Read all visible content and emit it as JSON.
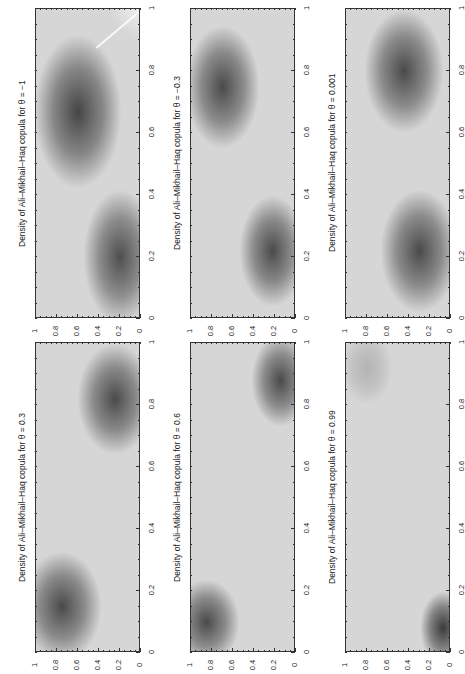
{
  "chart_data": [
    {
      "type": "heatmap",
      "title": "Density of Ali–Mikhail–Haq copula for θ = −1",
      "theta": -1,
      "xlabel": "",
      "ylabel": "",
      "x_ticks": [
        "0",
        "0.2",
        "0.4",
        "0.6",
        "0.8",
        "1"
      ],
      "y_ticks": [
        "0",
        "0.2",
        "0.4",
        "0.6",
        "0.8",
        "1"
      ],
      "xlim": [
        0,
        1
      ],
      "ylim": [
        0,
        1
      ],
      "rotation": "page rotated 90° counter-clockwise",
      "dark_regions_visual": [
        {
          "cx": 40,
          "cy": 33,
          "rx": 42,
          "ry": 25,
          "alpha": 0.75
        },
        {
          "cx": 80,
          "cy": 80,
          "rx": 35,
          "ry": 22,
          "alpha": 0.7
        }
      ],
      "corner_light": true
    },
    {
      "type": "heatmap",
      "title": "Density of Ali–Mikhail–Haq copula for θ = −0.3",
      "theta": -0.3,
      "x_ticks": [
        "0",
        "0.2",
        "0.4",
        "0.6",
        "0.8",
        "1"
      ],
      "y_ticks": [
        "0",
        "0.2",
        "0.4",
        "0.6",
        "0.8",
        "1"
      ],
      "xlim": [
        0,
        1
      ],
      "ylim": [
        0,
        1
      ],
      "dark_regions_visual": [
        {
          "cx": 30,
          "cy": 25,
          "rx": 36,
          "ry": 20,
          "alpha": 0.72
        },
        {
          "cx": 78,
          "cy": 78,
          "rx": 32,
          "ry": 18,
          "alpha": 0.72
        }
      ],
      "corner_light": false
    },
    {
      "type": "heatmap",
      "title": "Density of Ali–Mikhail–Haq copula for θ = 0.001",
      "theta": 0.001,
      "x_ticks": [
        "0",
        "0.2",
        "0.4",
        "0.6",
        "0.8",
        "1"
      ],
      "y_ticks": [
        "0",
        "0.2",
        "0.4",
        "0.6",
        "0.8",
        "1"
      ],
      "xlim": [
        0,
        1
      ],
      "ylim": [
        0,
        1
      ],
      "dark_regions_visual": [
        {
          "cx": 55,
          "cy": 20,
          "rx": 38,
          "ry": 20,
          "alpha": 0.72
        },
        {
          "cx": 70,
          "cy": 78,
          "rx": 38,
          "ry": 20,
          "alpha": 0.72
        }
      ],
      "corner_light": false
    },
    {
      "type": "heatmap",
      "title": "Density of Ali–Mikhail–Haq copula for θ = 0.3",
      "theta": 0.3,
      "x_ticks": [
        "0",
        "0.2",
        "0.4",
        "0.6",
        "0.8",
        "1"
      ],
      "y_ticks": [
        "0",
        "0.2",
        "0.4",
        "0.6",
        "0.8",
        "1"
      ],
      "xlim": [
        0,
        1
      ],
      "ylim": [
        0,
        1
      ],
      "dark_regions_visual": [
        {
          "cx": 75,
          "cy": 18,
          "rx": 36,
          "ry": 18,
          "alpha": 0.72
        },
        {
          "cx": 25,
          "cy": 85,
          "rx": 38,
          "ry": 18,
          "alpha": 0.72
        }
      ],
      "corner_light": false
    },
    {
      "type": "heatmap",
      "title": "Density of Ali–Mikhail–Haq copula for θ = 0.6",
      "theta": 0.6,
      "x_ticks": [
        "0",
        "0.2",
        "0.4",
        "0.6",
        "0.8",
        "1"
      ],
      "y_ticks": [
        "0",
        "0.2",
        "0.4",
        "0.6",
        "0.8",
        "1"
      ],
      "xlim": [
        0,
        1
      ],
      "ylim": [
        0,
        1
      ],
      "dark_regions_visual": [
        {
          "cx": 85,
          "cy": 12,
          "rx": 28,
          "ry": 15,
          "alpha": 0.72
        },
        {
          "cx": 15,
          "cy": 90,
          "rx": 32,
          "ry": 14,
          "alpha": 0.72
        }
      ],
      "corner_light": false
    },
    {
      "type": "heatmap",
      "title": "Density of Ali–Mikhail–Haq copula for θ = 0.99",
      "theta": 0.99,
      "x_ticks": [
        "0",
        "0.2",
        "0.4",
        "0.6",
        "0.8",
        "1"
      ],
      "y_ticks": [
        "0",
        "0.2",
        "0.4",
        "0.6",
        "0.8",
        "1"
      ],
      "xlim": [
        0,
        1
      ],
      "ylim": [
        0,
        1
      ],
      "dark_regions_visual": [
        {
          "cx": 92,
          "cy": 92,
          "rx": 22,
          "ry": 12,
          "alpha": 0.8
        },
        {
          "cx": 20,
          "cy": 8,
          "rx": 25,
          "ry": 12,
          "alpha": 0.18
        }
      ],
      "corner_light": false
    }
  ],
  "layout": {
    "columns_x": [
      35,
      190,
      345
    ],
    "rows_y": [
      8,
      342
    ],
    "box_w": 105,
    "box_h": 310
  }
}
